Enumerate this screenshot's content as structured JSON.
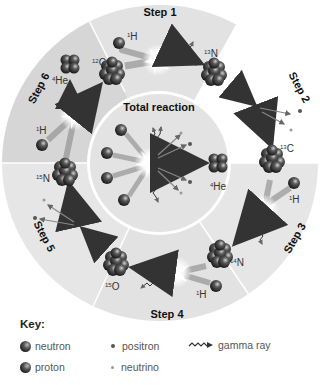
{
  "diagram": {
    "center_label": "Total reaction",
    "steps": [
      {
        "label": "Step 1",
        "reactants": [
          "12C",
          "1H"
        ],
        "products": [
          "13N",
          "gamma ray"
        ]
      },
      {
        "label": "Step 2",
        "reactants": [
          "13N"
        ],
        "products": [
          "13C",
          "positron",
          "neutrino"
        ]
      },
      {
        "label": "Step 3",
        "reactants": [
          "13C",
          "1H"
        ],
        "products": [
          "14N",
          "gamma ray"
        ]
      },
      {
        "label": "Step 4",
        "reactants": [
          "14N",
          "1H"
        ],
        "products": [
          "15O",
          "gamma ray"
        ]
      },
      {
        "label": "Step 5",
        "reactants": [
          "15O"
        ],
        "products": [
          "15N",
          "positron",
          "neutrino"
        ]
      },
      {
        "label": "Step 6",
        "reactants": [
          "15N",
          "1H"
        ],
        "products": [
          "12C",
          "4He"
        ]
      }
    ],
    "isotopes": {
      "h1": {
        "sup": "1",
        "sym": "H"
      },
      "c12": {
        "sup": "12",
        "sym": "C"
      },
      "n13": {
        "sup": "13",
        "sym": "N"
      },
      "c13": {
        "sup": "13",
        "sym": "C"
      },
      "n14": {
        "sup": "14",
        "sym": "N"
      },
      "o15": {
        "sup": "15",
        "sym": "O"
      },
      "n15": {
        "sup": "15",
        "sym": "N"
      },
      "he4": {
        "sup": "4",
        "sym": "He"
      }
    },
    "total_reaction": {
      "reactants": "4 × 1H",
      "products": [
        "4He",
        "2 positrons",
        "2 neutrinos",
        "3 gamma rays"
      ]
    }
  },
  "key": {
    "title": "Key:",
    "items": [
      {
        "label": "neutron",
        "icon": "ball"
      },
      {
        "label": "proton",
        "icon": "ball"
      },
      {
        "label": "positron",
        "icon": "dark-dot"
      },
      {
        "label": "neutrino",
        "icon": "light-dot"
      },
      {
        "label": "gamma ray",
        "icon": "wavy-arrow"
      }
    ]
  },
  "colors": {
    "background": "#ffffff",
    "sector_light": "#e4e4e4",
    "sector_dark": "#d4d4d4",
    "inner_circle": "#e2e2e2",
    "particle": "#3a3a3a",
    "arrow": "#666666"
  }
}
